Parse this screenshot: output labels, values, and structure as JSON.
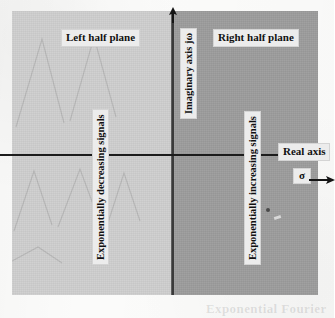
{
  "figure": {
    "type": "s-plane-region-diagram",
    "regions": [
      {
        "name": "left-half-plane",
        "label": "Left half plane",
        "annotation": "Exponentially decreasing signals",
        "fill": "#cfcfcf"
      },
      {
        "name": "right-half-plane",
        "label": "Right half plane",
        "annotation": "Exponentially increasing signals",
        "fill": "#9d9d9d"
      }
    ],
    "axes": {
      "vertical": {
        "label": "Imaginary axis  jω",
        "arrow_direction": "up",
        "color": "#3a3a3a"
      },
      "horizontal": {
        "label": "Real axis",
        "variable": "σ",
        "arrow_direction": "right",
        "color": "#1c1c1c"
      }
    },
    "colors": {
      "page_background": "#fbfbfa",
      "left_plane": "#cfcfcf",
      "right_plane": "#9d9d9d",
      "axis_line": "#1c1c1c",
      "label_background": "#ececec",
      "label_text": "#111111"
    },
    "bleed_through_text": "Exponential Fourier"
  }
}
